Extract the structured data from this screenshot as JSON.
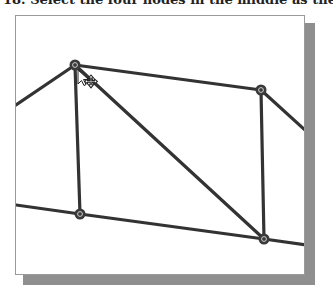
{
  "caption": {
    "text": "18. Select the four nodes in the middle as the location"
  },
  "viewport": {
    "frame": {
      "x": 15,
      "y": 15,
      "w": 290,
      "h": 260,
      "border": "#9a9a9a",
      "shadow": "#8f8f8f"
    },
    "line_color": "#333333",
    "nodes": [
      {
        "id": "node-top-left",
        "x": 75,
        "y": 65
      },
      {
        "id": "node-top-right",
        "x": 261,
        "y": 90
      },
      {
        "id": "node-bottom-left",
        "x": 80,
        "y": 214
      },
      {
        "id": "node-bottom-right",
        "x": 264,
        "y": 239
      }
    ],
    "elements": [
      {
        "from": [
          16,
          105
        ],
        "to": [
          75,
          65
        ]
      },
      {
        "from": [
          75,
          65
        ],
        "to": [
          261,
          90
        ]
      },
      {
        "from": [
          261,
          90
        ],
        "to": [
          306,
          131
        ]
      },
      {
        "from": [
          75,
          65
        ],
        "to": [
          80,
          214
        ]
      },
      {
        "from": [
          261,
          90
        ],
        "to": [
          264,
          239
        ]
      },
      {
        "from": [
          75,
          65
        ],
        "to": [
          264,
          239
        ]
      },
      {
        "from": [
          16,
          205
        ],
        "to": [
          80,
          214
        ]
      },
      {
        "from": [
          80,
          214
        ],
        "to": [
          264,
          239
        ]
      },
      {
        "from": [
          264,
          239
        ],
        "to": [
          306,
          245
        ]
      }
    ],
    "cursor": {
      "type": "move-cursor",
      "x": 78,
      "y": 70
    }
  }
}
